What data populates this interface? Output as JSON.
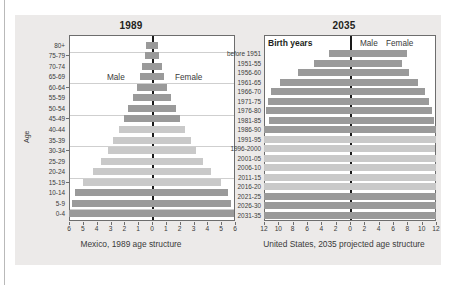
{
  "page": {
    "top_ghost_text": "",
    "background": "#eceae9",
    "bar_dark": "#9a9a9a",
    "bar_light": "#c9c9c9",
    "axis_color": "#1a1a1a"
  },
  "left_panel": {
    "title": "1989",
    "caption": "Mexico, 1989 age structure",
    "y_axis_title": "Age",
    "male_label": "Male",
    "female_label": "Female"
  },
  "right_panel": {
    "title": "2035",
    "caption": "United States, 2035 projected age structure",
    "legend_header": "Birth years",
    "male_label": "Male",
    "female_label": "Female"
  },
  "chart_data": [
    {
      "type": "bar",
      "subtype": "population-pyramid",
      "title": "1989",
      "caption": "Mexico, 1989 age structure",
      "xlabel": "",
      "ylabel": "Age",
      "xlim": [
        -6,
        6
      ],
      "xticks": [
        6,
        5,
        4,
        3,
        2,
        1,
        0,
        1,
        2,
        3,
        4,
        5,
        6
      ],
      "grid": true,
      "legend": [
        "Male",
        "Female"
      ],
      "categories": [
        "80+",
        "75-79",
        "70-74",
        "65-69",
        "60-64",
        "55-59",
        "50-54",
        "45-49",
        "40-44",
        "35-39",
        "30-34",
        "25-29",
        "20-24",
        "15-19",
        "10-14",
        "5-9",
        "0-4"
      ],
      "series": [
        {
          "name": "Male",
          "side": "left",
          "values": [
            0.4,
            0.5,
            0.7,
            0.9,
            1.1,
            1.4,
            1.7,
            2.0,
            2.4,
            2.8,
            3.2,
            3.7,
            4.3,
            5.0,
            5.6,
            5.8,
            6.0
          ]
        },
        {
          "name": "Female",
          "side": "right",
          "values": [
            0.4,
            0.5,
            0.7,
            0.9,
            1.1,
            1.4,
            1.7,
            2.0,
            2.4,
            2.8,
            3.2,
            3.7,
            4.3,
            5.0,
            5.5,
            5.7,
            5.9
          ]
        }
      ],
      "bar_shades": [
        "dark",
        "dark",
        "dark",
        "dark",
        "dark",
        "dark",
        "dark",
        "dark",
        "light",
        "light",
        "light",
        "light",
        "light",
        "light",
        "dark",
        "dark",
        "dark"
      ]
    },
    {
      "type": "bar",
      "subtype": "population-pyramid",
      "title": "2035",
      "caption": "United States, 2035 projected age structure",
      "xlabel": "",
      "ylabel": "Birth years",
      "xlim": [
        -12,
        12
      ],
      "xticks": [
        12,
        10,
        8,
        6,
        4,
        2,
        0,
        2,
        4,
        6,
        8,
        10,
        12
      ],
      "grid": true,
      "legend": [
        "Male",
        "Female"
      ],
      "categories": [
        "before 1951",
        "1951-55",
        "1956-60",
        "1961-65",
        "1966-70",
        "1971-75",
        "1976-80",
        "1981-85",
        "1986-90",
        "1991-95",
        "1996-2000",
        "2001-05",
        "2006-10",
        "2011-15",
        "2016-20",
        "2021-25",
        "2026-30",
        "2031-35"
      ],
      "series": [
        {
          "name": "Male",
          "side": "left",
          "values": [
            3.0,
            5.0,
            7.2,
            9.8,
            11.0,
            11.4,
            11.7,
            11.3,
            12.0,
            12.0,
            12.0,
            12.0,
            12.0,
            12.0,
            12.0,
            12.0,
            12.0,
            12.0
          ]
        },
        {
          "name": "Female",
          "side": "right",
          "values": [
            8.0,
            7.2,
            8.3,
            9.5,
            10.4,
            11.0,
            11.4,
            11.7,
            12.0,
            12.0,
            11.9,
            12.0,
            12.0,
            12.0,
            12.0,
            12.0,
            12.0,
            12.0
          ]
        }
      ],
      "bar_shades": [
        "dark",
        "dark",
        "dark",
        "dark",
        "dark",
        "dark",
        "dark",
        "dark",
        "dark",
        "light",
        "light",
        "light",
        "light",
        "light",
        "light",
        "dark",
        "dark",
        "dark"
      ]
    }
  ]
}
